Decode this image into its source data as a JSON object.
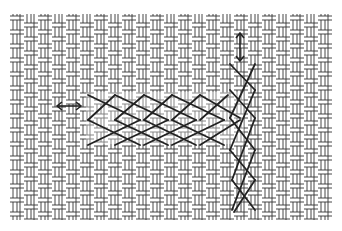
{
  "figure": {
    "caption": "Cross stitch worked on woven canvas: horizontal row and vertical row",
    "background": "#ffffff",
    "canvas_color": "#3a3a3a",
    "stitch_color": "#222222",
    "canvas_bounds": {
      "x": 10,
      "y": 14,
      "width": 322,
      "height": 206
    },
    "horizontal_row": {
      "arrow": "double-horizontal-arrow",
      "stitch_count": 5
    },
    "vertical_row": {
      "arrow": "double-vertical-arrow",
      "stitch_count": 5
    }
  }
}
